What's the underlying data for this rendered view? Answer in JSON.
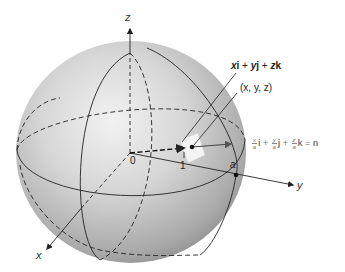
{
  "diagram": {
    "type": "sphere-normal-vector",
    "axes": {
      "z_label": "z",
      "y_label": "y",
      "x_label": "x"
    },
    "labels": {
      "origin": "0",
      "unit_tick": "1",
      "radius_point": "a",
      "position_vector": {
        "x": "x",
        "i": "i",
        "plus1": " + ",
        "y": "y",
        "j": "j",
        "plus2": " + ",
        "z": "z",
        "k": "k"
      },
      "point": "(x, y, z)",
      "normal": {
        "x_num": "x",
        "x_den": "a",
        "i": "i",
        "plus1": " + ",
        "y_num": "y",
        "y_den": "a",
        "j": "j",
        "plus2": " + ",
        "z_num": "z",
        "z_den": "a",
        "k": "k",
        "eq": " = ",
        "n": "n"
      }
    },
    "colors": {
      "sphere_light": "#ececec",
      "sphere_mid": "#c8c8c8",
      "sphere_dark": "#8f8f8f",
      "line": "#222222",
      "normal_text": "#777777",
      "plane_patch": "#f4f4f4"
    }
  }
}
